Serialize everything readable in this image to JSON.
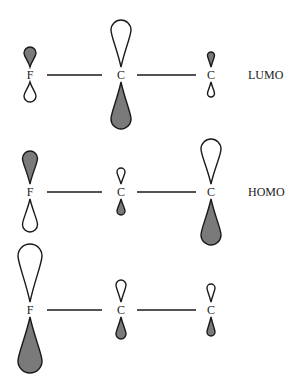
{
  "colors": {
    "filled_lobe": "#7a7a7a",
    "open_lobe": "#ffffff",
    "stroke": "#1a1a1a"
  },
  "rows": [
    {
      "label": "LUMO",
      "y": 75,
      "atoms": [
        {
          "symbol": "F",
          "x": 30,
          "top": {
            "len": 20,
            "w": 12,
            "filled": true
          },
          "bottom": {
            "len": 20,
            "w": 12,
            "filled": false
          }
        },
        {
          "symbol": "C",
          "x": 121,
          "top": {
            "len": 47,
            "w": 20,
            "filled": false
          },
          "bottom": {
            "len": 47,
            "w": 20,
            "filled": true
          }
        },
        {
          "symbol": "C",
          "x": 211,
          "top": {
            "len": 15,
            "w": 7,
            "filled": true
          },
          "bottom": {
            "len": 15,
            "w": 7,
            "filled": false
          }
        }
      ]
    },
    {
      "label": "HOMO",
      "y": 192,
      "atoms": [
        {
          "symbol": "F",
          "x": 30,
          "top": {
            "len": 33,
            "w": 15,
            "filled": true
          },
          "bottom": {
            "len": 33,
            "w": 15,
            "filled": false
          }
        },
        {
          "symbol": "C",
          "x": 121,
          "top": {
            "len": 16,
            "w": 8,
            "filled": false
          },
          "bottom": {
            "len": 16,
            "w": 8,
            "filled": true
          }
        },
        {
          "symbol": "C",
          "x": 211,
          "top": {
            "len": 45,
            "w": 20,
            "filled": false
          },
          "bottom": {
            "len": 46,
            "w": 20,
            "filled": true
          }
        }
      ]
    },
    {
      "label": "",
      "y": 310,
      "atoms": [
        {
          "symbol": "F",
          "x": 30,
          "top": {
            "len": 58,
            "w": 24,
            "filled": false
          },
          "bottom": {
            "len": 56,
            "w": 24,
            "filled": true
          }
        },
        {
          "symbol": "C",
          "x": 121,
          "top": {
            "len": 22,
            "w": 10,
            "filled": false
          },
          "bottom": {
            "len": 22,
            "w": 10,
            "filled": true
          }
        },
        {
          "symbol": "C",
          "x": 211,
          "top": {
            "len": 18,
            "w": 8,
            "filled": false
          },
          "bottom": {
            "len": 19,
            "w": 8,
            "filled": true
          }
        }
      ]
    }
  ],
  "bonds": [
    {
      "x1": 47,
      "x2": 102
    },
    {
      "x1": 137,
      "x2": 196
    }
  ],
  "label_x": 248
}
